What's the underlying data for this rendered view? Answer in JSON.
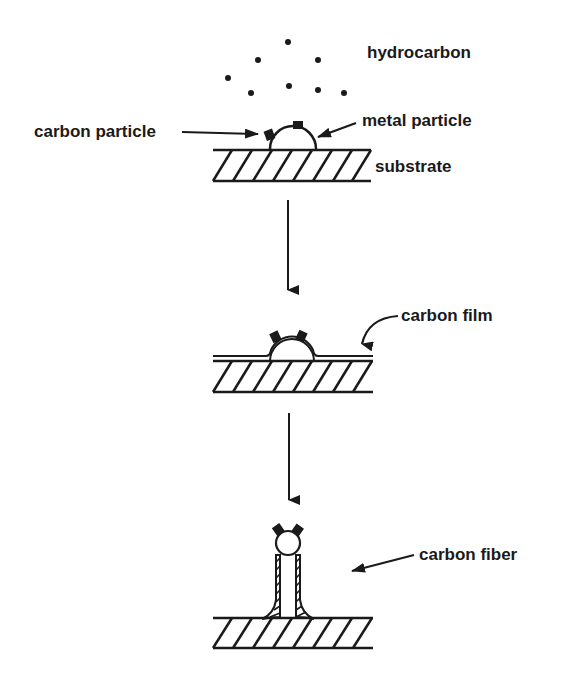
{
  "diagram": {
    "colors": {
      "ink": "#1a1a1a",
      "background": "#ffffff"
    },
    "stages": [
      {
        "id": "stage-1",
        "labels": {
          "hydrocarbon": "hydrocarbon",
          "carbon_particle": "carbon particle",
          "metal_particle": "metal particle",
          "substrate": "substrate"
        }
      },
      {
        "id": "stage-2",
        "labels": {
          "carbon_film": "carbon film"
        }
      },
      {
        "id": "stage-3",
        "labels": {
          "carbon_fiber": "carbon fiber"
        }
      }
    ]
  }
}
